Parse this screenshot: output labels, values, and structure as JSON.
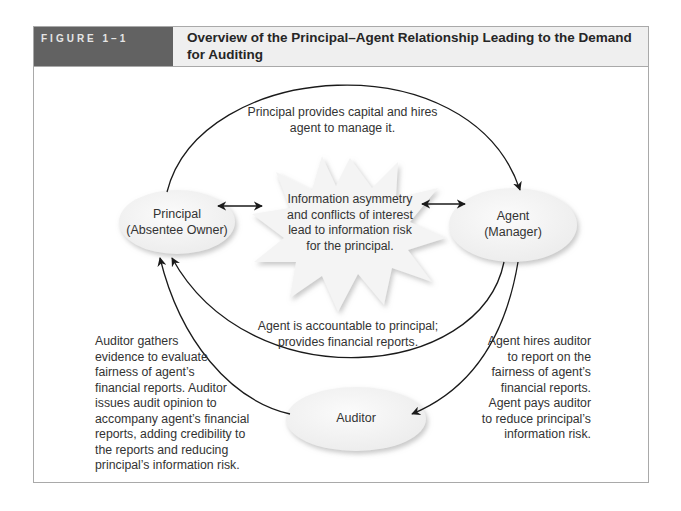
{
  "figure": {
    "label": "FIGURE 1–1",
    "title": "Overview of the Principal–Agent Relationship Leading to the Demand for Auditing"
  },
  "nodes": {
    "principal": {
      "line1": "Principal",
      "line2": "(Absentee Owner)"
    },
    "agent": {
      "line1": "Agent",
      "line2": "(Manager)"
    },
    "auditor": {
      "line1": "Auditor"
    },
    "center_burst": {
      "lines": [
        "Information asymmetry",
        "and conflicts of interest",
        "lead to information risk",
        "for the principal."
      ]
    }
  },
  "annotations": {
    "top": [
      "Principal provides capital and hires",
      "agent to manage it."
    ],
    "middle": [
      "Agent is accountable to principal;",
      "provides financial reports."
    ],
    "left": [
      "Auditor gathers",
      "evidence to evaluate",
      "fairness of agent’s",
      "financial reports. Auditor",
      "issues audit opinion to",
      "accompany agent’s financial",
      "reports, adding credibility to",
      "the reports and reducing",
      "principal’s information risk."
    ],
    "right": [
      "Agent hires auditor",
      "to report on the",
      "fairness of agent’s",
      "financial reports.",
      "Agent pays auditor",
      "to reduce principal’s",
      "information risk."
    ]
  },
  "colors": {
    "label_bg": "#626262",
    "title_bg": "#efefef",
    "border": "#a9a9a9",
    "ellipse_fill": "#f1f1f1",
    "line": "#1a1a1a"
  }
}
